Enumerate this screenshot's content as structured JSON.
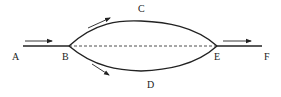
{
  "diagram": {
    "type": "flow-split",
    "labels": {
      "A": "A",
      "B": "B",
      "C": "C",
      "D": "D",
      "E": "E",
      "F": "F"
    },
    "colors": {
      "stroke": "#222222",
      "background": "#ffffff"
    },
    "nodes": [
      {
        "id": "A",
        "role": "inlet"
      },
      {
        "id": "B",
        "role": "split-point"
      },
      {
        "id": "C",
        "role": "upper-branch"
      },
      {
        "id": "D",
        "role": "lower-branch"
      },
      {
        "id": "E",
        "role": "merge-point"
      },
      {
        "id": "F",
        "role": "outlet"
      }
    ],
    "edges": [
      {
        "from": "A",
        "to": "B",
        "style": "solid",
        "arrow": "right"
      },
      {
        "from": "B",
        "to": "E",
        "via": "C",
        "style": "solid-curve",
        "arrow": "up-right"
      },
      {
        "from": "B",
        "to": "E",
        "via": "D",
        "style": "solid-curve",
        "arrow": "down-right"
      },
      {
        "from": "B",
        "to": "E",
        "style": "dashed"
      },
      {
        "from": "E",
        "to": "F",
        "style": "solid",
        "arrow": "right"
      }
    ]
  }
}
